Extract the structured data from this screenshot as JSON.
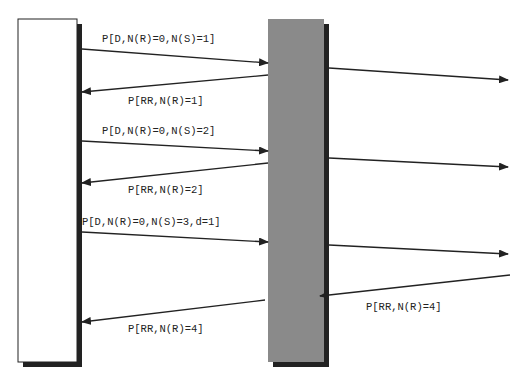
{
  "diagram": {
    "type": "sequence-diagram",
    "colors": {
      "background": "#ffffff",
      "left_entity_fill": "#ffffff",
      "middle_entity_fill": "#8a8a8a",
      "shadow": "#222222",
      "arrow": "#222222",
      "text": "#222222"
    },
    "entities": [
      {
        "id": "left-station",
        "label": ""
      },
      {
        "id": "middle-node",
        "label": ""
      }
    ],
    "messages": [
      {
        "label": "P[D,N(R)=0,N(S)=1]",
        "from": "left-station",
        "to": "middle-node"
      },
      {
        "label": "",
        "from": "middle-node",
        "to": "right-offscreen"
      },
      {
        "label": "P[RR,N(R)=1]",
        "from": "middle-node",
        "to": "left-station"
      },
      {
        "label": "P[D,N(R)=0,N(S)=2]",
        "from": "left-station",
        "to": "middle-node"
      },
      {
        "label": "",
        "from": "middle-node",
        "to": "right-offscreen"
      },
      {
        "label": "P[RR,N(R)=2]",
        "from": "middle-node",
        "to": "left-station"
      },
      {
        "label": "P[D,N(R)=0,N(S)=3,d=1]",
        "from": "left-station",
        "to": "middle-node"
      },
      {
        "label": "",
        "from": "middle-node",
        "to": "right-offscreen"
      },
      {
        "label": "P[RR,N(R)=4]",
        "from": "right-offscreen",
        "to": "middle-node"
      },
      {
        "label": "P[RR,N(R)=4]",
        "from": "middle-node",
        "to": "left-station"
      }
    ]
  }
}
